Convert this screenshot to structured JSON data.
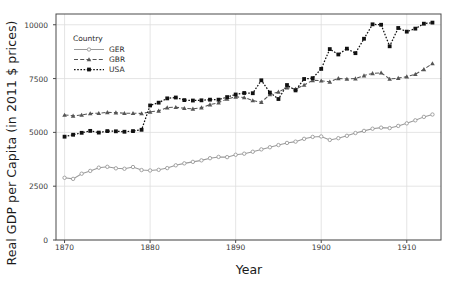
{
  "chart_data": {
    "type": "line",
    "title": "",
    "xlabel": "Year",
    "ylabel": "Real GDP per Capita (in 2011 $ prices)",
    "xlim": [
      1869,
      1914
    ],
    "ylim": [
      0,
      10500
    ],
    "xticks": [
      1870,
      1880,
      1890,
      1900,
      1910
    ],
    "yticks": [
      0,
      2500,
      5000,
      7500,
      10000
    ],
    "grid": true,
    "legend_position": "top-left-inside",
    "legend_title": "Country",
    "x": [
      1870,
      1871,
      1872,
      1873,
      1874,
      1875,
      1876,
      1877,
      1878,
      1879,
      1880,
      1881,
      1882,
      1883,
      1884,
      1885,
      1886,
      1887,
      1888,
      1889,
      1890,
      1891,
      1892,
      1893,
      1894,
      1895,
      1896,
      1897,
      1898,
      1899,
      1900,
      1901,
      1902,
      1903,
      1904,
      1905,
      1906,
      1907,
      1908,
      1909,
      1910,
      1911,
      1912,
      1913
    ],
    "series": [
      {
        "name": "GER",
        "color": "#9a9a9a",
        "marker": "circle",
        "dash": "solid",
        "values": [
          2890,
          2840,
          3080,
          3210,
          3360,
          3400,
          3330,
          3310,
          3390,
          3250,
          3230,
          3260,
          3340,
          3470,
          3560,
          3630,
          3700,
          3800,
          3860,
          3850,
          3960,
          4010,
          4100,
          4210,
          4310,
          4410,
          4510,
          4570,
          4700,
          4790,
          4810,
          4650,
          4730,
          4840,
          4970,
          5070,
          5170,
          5220,
          5200,
          5300,
          5420,
          5560,
          5720,
          5830
        ]
      },
      {
        "name": "GBR",
        "color": "#555555",
        "marker": "triangle",
        "dash": "dashed",
        "values": [
          5810,
          5770,
          5810,
          5880,
          5890,
          5930,
          5920,
          5890,
          5890,
          5880,
          5950,
          6000,
          6150,
          6170,
          6120,
          6090,
          6150,
          6290,
          6380,
          6550,
          6650,
          6620,
          6480,
          6400,
          6760,
          6880,
          7080,
          7010,
          7200,
          7420,
          7400,
          7350,
          7510,
          7480,
          7500,
          7640,
          7740,
          7770,
          7480,
          7520,
          7590,
          7700,
          7930,
          8200
        ]
      },
      {
        "name": "USA",
        "color": "#111111",
        "marker": "square",
        "dash": "dotted",
        "values": [
          4800,
          4890,
          4980,
          5070,
          4990,
          5060,
          5050,
          5030,
          5060,
          5120,
          6250,
          6380,
          6580,
          6620,
          6500,
          6480,
          6490,
          6520,
          6520,
          6640,
          6760,
          6830,
          6820,
          7420,
          6850,
          6550,
          7200,
          6950,
          7480,
          7520,
          7950,
          8870,
          8620,
          8890,
          8680,
          9350,
          10020,
          10000,
          9000,
          9850,
          9680,
          9820,
          10050,
          10100
        ]
      }
    ]
  },
  "legend": {
    "title": "Country",
    "entries": [
      {
        "label": "GER"
      },
      {
        "label": "GBR"
      },
      {
        "label": "USA"
      }
    ]
  },
  "axes": {
    "x_title": "Year",
    "y_title": "Real GDP per Capita (in 2011 $ prices)",
    "x_tick_labels": [
      "1870",
      "1880",
      "1890",
      "1900",
      "1910"
    ],
    "y_tick_labels": [
      "0",
      "2500",
      "5000",
      "7500",
      "10000"
    ]
  },
  "colors": {
    "ger": "#9a9a9a",
    "gbr": "#555555",
    "usa": "#111111",
    "grid": "#dedede",
    "frame": "#4a4a4a",
    "text": "#1a1a1a"
  }
}
